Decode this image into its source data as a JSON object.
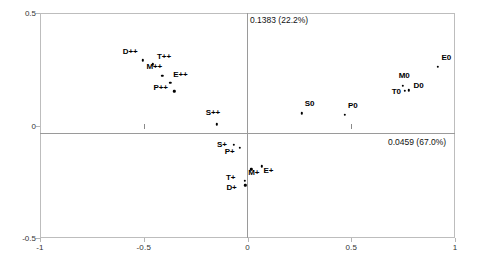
{
  "chart_data": {
    "type": "scatter",
    "title": "",
    "xlabel": "0.0459 (67.0%)",
    "ylabel": "0.1383 (22.2%)",
    "xlim": [
      -1,
      1
    ],
    "ylim": [
      -0.5,
      0.5
    ],
    "xticks": [
      "-1",
      "-0.5",
      "0",
      "0.5",
      "1"
    ],
    "xtick_values": [
      -1,
      -0.5,
      0,
      0.5,
      1
    ],
    "yticks": [
      "0.5",
      "0",
      "-0.5"
    ],
    "ytick_values": [
      0.5,
      0,
      -0.5
    ],
    "grid": false,
    "legend": "none",
    "axis_annotations": {
      "vertical": "0.1383 (22.2%)",
      "horizontal": "0.0459 (67.0%)"
    },
    "points": [
      {
        "label": "D++",
        "x": -0.505,
        "y": 0.29,
        "label_dx": -20,
        "label_dy": -9
      },
      {
        "label": "T++",
        "x": -0.455,
        "y": 0.272,
        "label_dx": 4,
        "label_dy": -8
      },
      {
        "label": "M++",
        "x": -0.41,
        "y": 0.222,
        "label_dx": -16,
        "label_dy": -10
      },
      {
        "label": "E++",
        "x": -0.372,
        "y": 0.19,
        "label_dx": 3,
        "label_dy": -9
      },
      {
        "label": "P++",
        "x": -0.352,
        "y": 0.152,
        "label_dx": -21,
        "label_dy": -4
      },
      {
        "label": "S++",
        "x": -0.148,
        "y": 0.005,
        "label_dx": -11,
        "label_dy": -12
      },
      {
        "label": "S+",
        "x": -0.065,
        "y": -0.085,
        "label_dx": -17,
        "label_dy": -1
      },
      {
        "label": "P+",
        "x": -0.037,
        "y": -0.1,
        "label_dx": -15,
        "label_dy": 3
      },
      {
        "label": "M+",
        "x": 0.018,
        "y": -0.195,
        "label_dx": -3,
        "label_dy": 3
      },
      {
        "label": "E+",
        "x": 0.068,
        "y": -0.182,
        "label_dx": 2,
        "label_dy": 4
      },
      {
        "label": "T+",
        "x": -0.012,
        "y": -0.247,
        "label_dx": -19,
        "label_dy": -4
      },
      {
        "label": "D+",
        "x": -0.01,
        "y": -0.265,
        "label_dx": -19,
        "label_dy": 2
      },
      {
        "label": "S0",
        "x": 0.262,
        "y": 0.055,
        "label_dx": 3,
        "label_dy": -10
      },
      {
        "label": "P0",
        "x": 0.47,
        "y": 0.048,
        "label_dx": 3,
        "label_dy": -10
      },
      {
        "label": "M0",
        "x": 0.748,
        "y": 0.177,
        "label_dx": -4,
        "label_dy": -11
      },
      {
        "label": "T0",
        "x": 0.758,
        "y": 0.155,
        "label_dx": -13,
        "label_dy": 0
      },
      {
        "label": "D0",
        "x": 0.776,
        "y": 0.157,
        "label_dx": 5,
        "label_dy": -5
      },
      {
        "label": "E0",
        "x": 0.916,
        "y": 0.262,
        "label_dx": 4,
        "label_dy": -10
      }
    ]
  }
}
